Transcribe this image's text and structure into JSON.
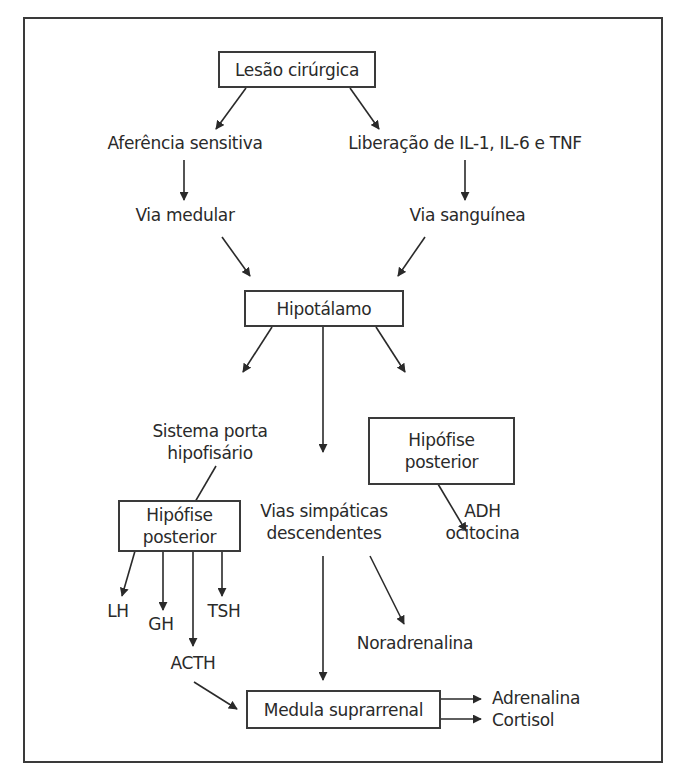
{
  "diagram": {
    "type": "flowchart",
    "nodes": {
      "lesao": {
        "text": "Lesão cirúrgica",
        "boxed": true
      },
      "aferencia": {
        "text": "Aferência sensitiva",
        "boxed": false
      },
      "liberacao": {
        "text": "Liberação de IL-1, IL-6 e TNF",
        "boxed": false
      },
      "via_medular": {
        "text": "Via medular",
        "boxed": false
      },
      "via_sanguinea": {
        "text": "Via sanguínea",
        "boxed": false
      },
      "hipotalamo": {
        "text": "Hipotálamo",
        "boxed": true
      },
      "sistema_porta": {
        "line1": "Sistema porta",
        "line2": "hipofisário",
        "boxed": false
      },
      "hipofise_right": {
        "line1": "Hipófise",
        "line2": "posterior",
        "boxed": true
      },
      "hipofise_left": {
        "line1": "Hipófise",
        "line2": "posterior",
        "boxed": true
      },
      "vias_simpaticas": {
        "line1": "Vias simpáticas",
        "line2": "descendentes",
        "boxed": false
      },
      "adh": {
        "line1": "ADH",
        "line2": "ocitocina",
        "boxed": false
      },
      "lh": {
        "text": "LH",
        "boxed": false
      },
      "gh": {
        "text": "GH",
        "boxed": false
      },
      "tsh": {
        "text": "TSH",
        "boxed": false
      },
      "acth": {
        "text": "ACTH",
        "boxed": false
      },
      "noradrenalina": {
        "text": "Noradrenalina",
        "boxed": false
      },
      "medula": {
        "text": "Medula suprarrenal",
        "boxed": true
      },
      "adrenalina": {
        "text": "Adrenalina",
        "boxed": false
      },
      "cortisol": {
        "text": "Cortisol",
        "boxed": false
      }
    },
    "edges": [
      [
        "lesao",
        "aferencia"
      ],
      [
        "lesao",
        "liberacao"
      ],
      [
        "aferencia",
        "via_medular"
      ],
      [
        "liberacao",
        "via_sanguinea"
      ],
      [
        "via_medular",
        "hipotalamo"
      ],
      [
        "via_sanguinea",
        "hipotalamo"
      ],
      [
        "hipotalamo",
        "sistema_porta"
      ],
      [
        "hipotalamo",
        "vias_simpaticas"
      ],
      [
        "hipotalamo",
        "hipofise_right"
      ],
      [
        "sistema_porta",
        "hipofise_left"
      ],
      [
        "hipofise_right",
        "adh"
      ],
      [
        "hipofise_left",
        "lh"
      ],
      [
        "hipofise_left",
        "gh"
      ],
      [
        "hipofise_left",
        "acth"
      ],
      [
        "hipofise_left",
        "tsh"
      ],
      [
        "vias_simpaticas",
        "medula"
      ],
      [
        "vias_simpaticas",
        "noradrenalina"
      ],
      [
        "acth",
        "medula"
      ],
      [
        "medula",
        "adrenalina"
      ],
      [
        "medula",
        "cortisol"
      ]
    ],
    "colors": {
      "line": "#2a2a2a",
      "text": "#2a2a2a",
      "background": "#ffffff"
    }
  }
}
